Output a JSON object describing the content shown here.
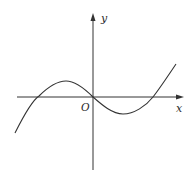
{
  "figure": {
    "type": "cubic-function-graph",
    "labels": {
      "x_axis": "x",
      "y_axis": "y",
      "origin": "O"
    },
    "colors": {
      "stroke": "#333333",
      "background": "#ffffff"
    },
    "curve": {
      "description": "cubic curve passing through origin, crossing x-axis at three points (negative root, origin, positive root), local maximum left of y-axis, local minimum right of y-axis"
    }
  }
}
